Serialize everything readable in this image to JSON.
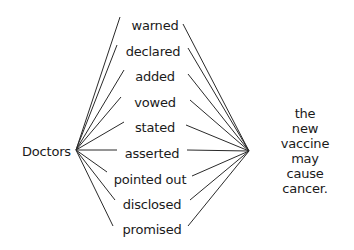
{
  "diagram": {
    "subject": "Doctors",
    "object": "the new\nvaccine may\ncause cancer.",
    "verbs": [
      {
        "label": "warned",
        "x": 155,
        "y": 25,
        "left": [
          120,
          17
        ],
        "right": [
          183,
          24
        ]
      },
      {
        "label": "declared",
        "x": 153,
        "y": 51,
        "left": [
          117,
          45
        ],
        "right": [
          188,
          48
        ]
      },
      {
        "label": "added",
        "x": 155,
        "y": 76,
        "left": [
          124,
          70
        ],
        "right": [
          188,
          74
        ]
      },
      {
        "label": "vowed",
        "x": 155,
        "y": 102,
        "left": [
          121,
          97
        ],
        "right": [
          190,
          100
        ]
      },
      {
        "label": "stated",
        "x": 155,
        "y": 127,
        "left": [
          124,
          122
        ],
        "right": [
          186,
          125
        ]
      },
      {
        "label": "asserted",
        "x": 152,
        "y": 153,
        "left": [
          117,
          150
        ],
        "right": [
          187,
          150
        ]
      },
      {
        "label": "pointed out",
        "x": 150,
        "y": 179,
        "left": [
          107,
          172
        ],
        "right": [
          192,
          176
        ]
      },
      {
        "label": "disclosed",
        "x": 152,
        "y": 204,
        "left": [
          115,
          200
        ],
        "right": [
          190,
          200
        ]
      },
      {
        "label": "promised",
        "x": 152,
        "y": 229,
        "left": [
          113,
          226
        ],
        "right": [
          188,
          226
        ]
      }
    ],
    "left_hub": [
      76,
      150
    ],
    "right_hub": [
      249,
      151
    ],
    "line_color": "#2a2a2a",
    "text_color": "#1a1a1a"
  }
}
